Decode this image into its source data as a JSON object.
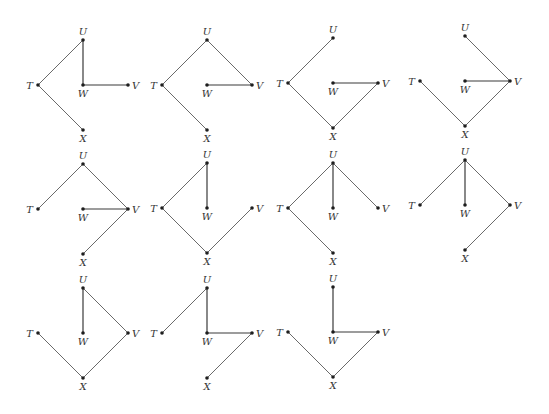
{
  "figure": {
    "vertex_labels": [
      "T",
      "U",
      "V",
      "W",
      "X"
    ],
    "layout_offsets": {
      "rows": [
        {
          "U": 0,
          "mid": 45,
          "X": 90
        }
      ],
      "local_positions": {
        "U": [
          0,
          0
        ],
        "T": [
          -45,
          45
        ],
        "W": [
          0,
          45
        ],
        "V": [
          45,
          45
        ],
        "X": [
          0,
          90
        ]
      }
    },
    "graphs": [
      {
        "id": 1,
        "origin": [
          83,
          40
        ],
        "edges": [
          [
            "T",
            "U"
          ],
          [
            "U",
            "W"
          ],
          [
            "W",
            "V"
          ],
          [
            "T",
            "X"
          ]
        ]
      },
      {
        "id": 2,
        "origin": [
          207,
          40
        ],
        "edges": [
          [
            "T",
            "U"
          ],
          [
            "U",
            "V"
          ],
          [
            "W",
            "V"
          ],
          [
            "T",
            "X"
          ]
        ]
      },
      {
        "id": 3,
        "origin": [
          333,
          38
        ],
        "edges": [
          [
            "T",
            "U"
          ],
          [
            "W",
            "V"
          ],
          [
            "T",
            "X"
          ],
          [
            "X",
            "V"
          ]
        ]
      },
      {
        "id": 4,
        "origin": [
          465,
          36
        ],
        "edges": [
          [
            "U",
            "V"
          ],
          [
            "W",
            "V"
          ],
          [
            "T",
            "X"
          ],
          [
            "X",
            "V"
          ]
        ]
      },
      {
        "id": 5,
        "origin": [
          83,
          164
        ],
        "edges": [
          [
            "T",
            "U"
          ],
          [
            "U",
            "V"
          ],
          [
            "W",
            "V"
          ],
          [
            "X",
            "V"
          ]
        ]
      },
      {
        "id": 6,
        "origin": [
          207,
          163
        ],
        "edges": [
          [
            "T",
            "U"
          ],
          [
            "U",
            "W"
          ],
          [
            "T",
            "X"
          ],
          [
            "X",
            "V"
          ]
        ]
      },
      {
        "id": 7,
        "origin": [
          333,
          163
        ],
        "edges": [
          [
            "T",
            "U"
          ],
          [
            "U",
            "W"
          ],
          [
            "U",
            "V"
          ],
          [
            "T",
            "X"
          ]
        ]
      },
      {
        "id": 8,
        "origin": [
          465,
          160
        ],
        "edges": [
          [
            "T",
            "U"
          ],
          [
            "U",
            "W"
          ],
          [
            "U",
            "V"
          ],
          [
            "X",
            "V"
          ]
        ]
      },
      {
        "id": 9,
        "origin": [
          83,
          288
        ],
        "edges": [
          [
            "U",
            "W"
          ],
          [
            "U",
            "V"
          ],
          [
            "T",
            "X"
          ],
          [
            "X",
            "V"
          ]
        ]
      },
      {
        "id": 10,
        "origin": [
          207,
          288
        ],
        "edges": [
          [
            "T",
            "U"
          ],
          [
            "U",
            "W"
          ],
          [
            "W",
            "V"
          ],
          [
            "X",
            "V"
          ]
        ]
      },
      {
        "id": 11,
        "origin": [
          333,
          287
        ],
        "edges": [
          [
            "U",
            "W"
          ],
          [
            "W",
            "V"
          ],
          [
            "T",
            "X"
          ],
          [
            "X",
            "V"
          ]
        ]
      }
    ]
  }
}
